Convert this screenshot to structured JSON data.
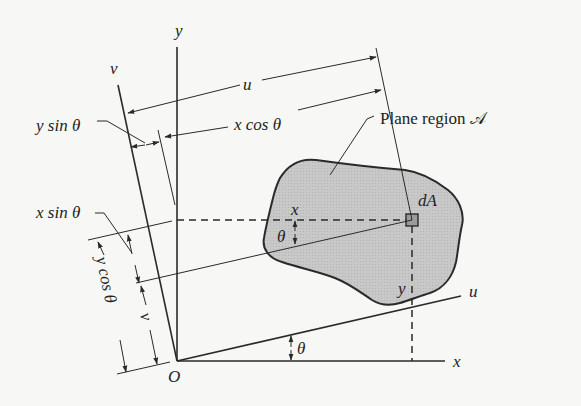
{
  "diagram": {
    "type": "rotation of axes for plane region (moments of inertia)",
    "axes": {
      "x": "x",
      "y": "y",
      "u": "u",
      "v": "v",
      "origin": "O"
    },
    "labels": {
      "region": "Plane region 𝒜",
      "element": "dA",
      "u_dim": "u",
      "v_dim": "v",
      "x_cos": "x cos θ",
      "y_sin": "y sin θ",
      "x_sin": "x sin θ",
      "y_cos": "y cos θ",
      "x_coord": "x",
      "y_coord": "y",
      "theta_axis": "θ",
      "theta_element": "θ"
    },
    "colors": {
      "region_fill": "#c4c4c4",
      "line": "#2a2a2a",
      "background": "#f7f7f5"
    }
  }
}
